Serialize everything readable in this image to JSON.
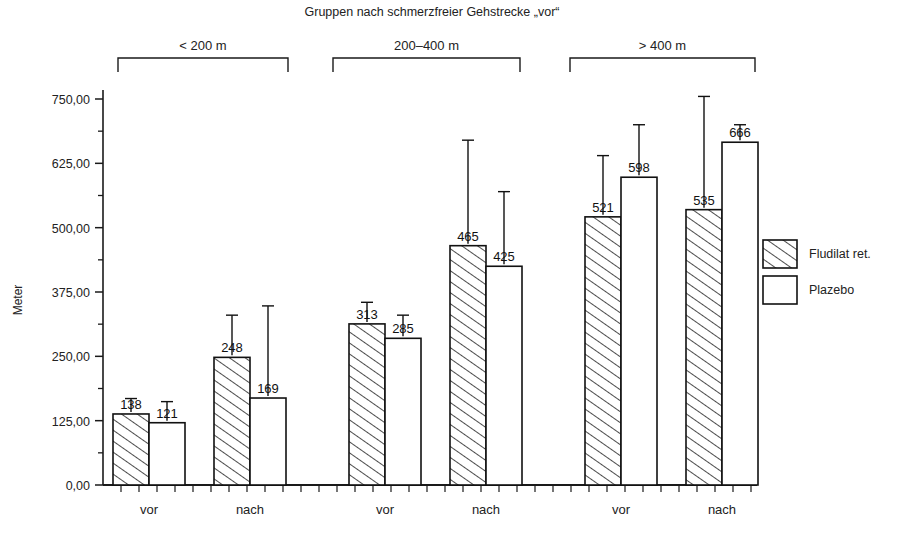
{
  "chart_data": {
    "type": "bar",
    "title": "Gruppen nach schmerzfreier Gehstrecke „vor“",
    "xlabel": "",
    "ylabel": "Meter",
    "ylim": [
      0,
      775
    ],
    "ytick_labels": [
      "0,00",
      "125,00",
      "250,00",
      "375,00",
      "500,00",
      "625,00",
      "750,00"
    ],
    "ytick_values": [
      0,
      125,
      250,
      375,
      500,
      625,
      750
    ],
    "minor_ticks": true,
    "grid": false,
    "legend_position": "right",
    "legend": [
      {
        "name": "Fludilat ret.",
        "pattern": "diagonal-hatch"
      },
      {
        "name": "Plazebo",
        "pattern": "white"
      }
    ],
    "group_labels": [
      "< 200 m",
      "200–400 m",
      "> 400 m"
    ],
    "categories": [
      "vor",
      "nach",
      "vor",
      "nach",
      "vor",
      "nach"
    ],
    "series": [
      {
        "name": "Fludilat ret.",
        "values": [
          138,
          248,
          313,
          465,
          521,
          535
        ]
      },
      {
        "name": "Plazebo",
        "values": [
          121,
          169,
          285,
          425,
          598,
          666
        ]
      }
    ],
    "error_bar_tops": {
      "Fludilat ret.": [
        168,
        330,
        355,
        670,
        640,
        755
      ],
      "Plazebo": [
        162,
        348,
        330,
        570,
        700,
        700
      ]
    },
    "bars": [
      {
        "group": "< 200 m",
        "category": "vor",
        "series": "Fludilat ret.",
        "value": 138,
        "label": "138"
      },
      {
        "group": "< 200 m",
        "category": "vor",
        "series": "Plazebo",
        "value": 121,
        "label": "121"
      },
      {
        "group": "< 200 m",
        "category": "nach",
        "series": "Fludilat ret.",
        "value": 248,
        "label": "248"
      },
      {
        "group": "< 200 m",
        "category": "nach",
        "series": "Plazebo",
        "value": 169,
        "label": "169"
      },
      {
        "group": "200–400 m",
        "category": "vor",
        "series": "Fludilat ret.",
        "value": 313,
        "label": "313"
      },
      {
        "group": "200–400 m",
        "category": "vor",
        "series": "Plazebo",
        "value": 285,
        "label": "285"
      },
      {
        "group": "200–400 m",
        "category": "nach",
        "series": "Fludilat ret.",
        "value": 465,
        "label": "465"
      },
      {
        "group": "200–400 m",
        "category": "nach",
        "series": "Plazebo",
        "value": 425,
        "label": "425"
      },
      {
        "group": "> 400 m",
        "category": "vor",
        "series": "Fludilat ret.",
        "value": 521,
        "label": "521"
      },
      {
        "group": "> 400 m",
        "category": "vor",
        "series": "Plazebo",
        "value": 598,
        "label": "598"
      },
      {
        "group": "> 400 m",
        "category": "nach",
        "series": "Fludilat ret.",
        "value": 535,
        "label": "535"
      },
      {
        "group": "> 400 m",
        "category": "nach",
        "series": "Plazebo",
        "value": 666,
        "label": "666"
      }
    ]
  },
  "colors": {
    "ink": "#1a1a1a",
    "background": "#ffffff",
    "bar_fill": "#ffffff",
    "hatch": "#111111"
  }
}
